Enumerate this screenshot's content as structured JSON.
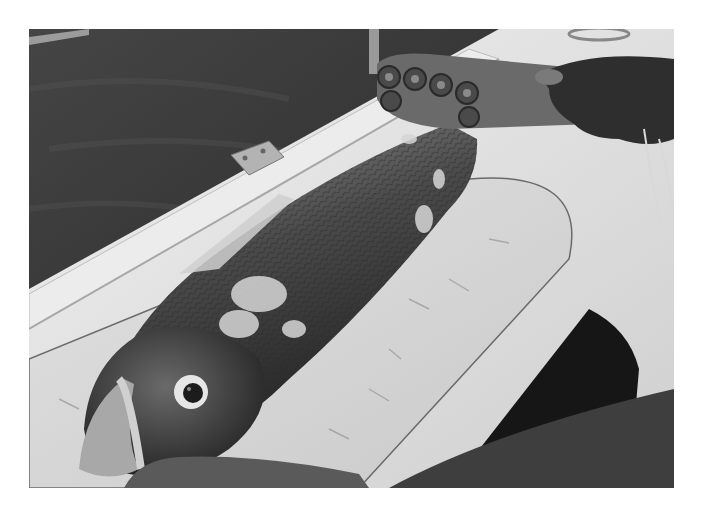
{
  "image": {
    "kind": "photograph",
    "color_mode": "grayscale",
    "border_color": "#ffffff",
    "subject": "large fish being scaled on a white boat deck with a bottle-cap scaler",
    "elements": [
      {
        "name": "water",
        "tone": "#3a3a3a"
      },
      {
        "name": "boat-gunwale-rail",
        "tone": "#e4e4e4"
      },
      {
        "name": "hinge",
        "tone": "#b8b8b8"
      },
      {
        "name": "cutting-board-hatch",
        "tone": "#dcdcdc"
      },
      {
        "name": "fish-body",
        "tone": "#505050"
      },
      {
        "name": "fish-head",
        "tone": "#3c3c3c"
      },
      {
        "name": "fish-eye",
        "tone": "#e8e8e8"
      },
      {
        "name": "scaler-tool-bottle-caps",
        "tone": "#5a5a5a"
      },
      {
        "name": "hand-holding-scaler",
        "tone": "#2a2a2a"
      },
      {
        "name": "hand-holding-fish-head",
        "tone": "#4a4a4a"
      },
      {
        "name": "dark-hull-shadow",
        "tone": "#1a1a1a"
      },
      {
        "name": "lower-right-sleeve",
        "tone": "#404040"
      }
    ]
  }
}
